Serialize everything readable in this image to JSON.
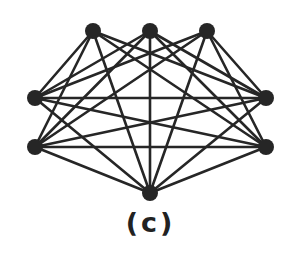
{
  "figure": {
    "caption": "(c)",
    "colors": {
      "edge": "#262626",
      "node": "#262626",
      "caption": "#222222",
      "background": "#ffffff"
    },
    "node_radius": 8,
    "nodes": [
      {
        "id": "T1",
        "x": 93,
        "y": 31
      },
      {
        "id": "T2",
        "x": 150,
        "y": 31
      },
      {
        "id": "T3",
        "x": 207,
        "y": 31
      },
      {
        "id": "L1",
        "x": 35,
        "y": 98
      },
      {
        "id": "L2",
        "x": 35,
        "y": 147
      },
      {
        "id": "R1",
        "x": 266,
        "y": 98
      },
      {
        "id": "R2",
        "x": 266,
        "y": 147
      },
      {
        "id": "B",
        "x": 150,
        "y": 193
      }
    ],
    "edges": [
      [
        "T1",
        "L1"
      ],
      [
        "T1",
        "L2"
      ],
      [
        "T1",
        "R1"
      ],
      [
        "T1",
        "R2"
      ],
      [
        "T1",
        "B"
      ],
      [
        "T2",
        "L1"
      ],
      [
        "T2",
        "L2"
      ],
      [
        "T2",
        "R1"
      ],
      [
        "T2",
        "R2"
      ],
      [
        "T2",
        "B"
      ],
      [
        "T3",
        "L1"
      ],
      [
        "T3",
        "L2"
      ],
      [
        "T3",
        "R1"
      ],
      [
        "T3",
        "R2"
      ],
      [
        "T3",
        "B"
      ],
      [
        "L1",
        "R1"
      ],
      [
        "L1",
        "R2"
      ],
      [
        "L1",
        "B"
      ],
      [
        "L2",
        "R1"
      ],
      [
        "L2",
        "R2"
      ],
      [
        "L2",
        "B"
      ],
      [
        "R1",
        "B"
      ],
      [
        "R2",
        "B"
      ]
    ]
  }
}
